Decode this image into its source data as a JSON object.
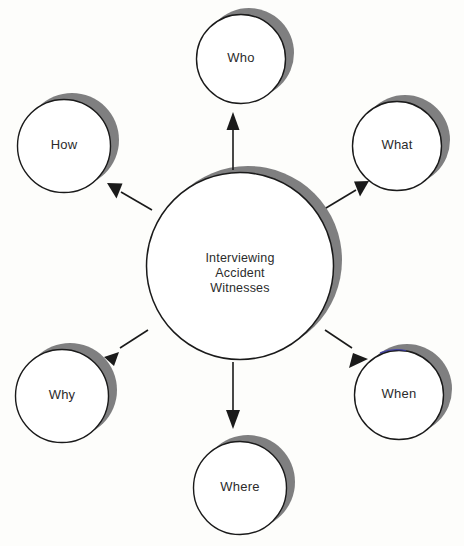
{
  "diagram": {
    "type": "hub-and-spoke-bubble-diagram",
    "title_text": "Interviewing Accident Witnesses",
    "background_color": "#fdfdfb",
    "shadow_color": "#7f7f80",
    "outline_color": "#1a1a1a",
    "text_color": "#2b2b2b",
    "center": {
      "name": "center-node",
      "lines": [
        "Interviewing",
        "Accident",
        "Witnesses"
      ],
      "line1": "Interviewing",
      "line2": "Accident",
      "line3": "Witnesses",
      "cx": 240,
      "cy": 266,
      "r": 94
    },
    "satellites": [
      {
        "id": "who",
        "label": "Who",
        "cx": 241,
        "cy": 59,
        "r": 45,
        "arrow_name": "arrow-center-to-who"
      },
      {
        "id": "what",
        "label": "What",
        "cx": 397,
        "cy": 146,
        "r": 45,
        "arrow_name": "arrow-center-to-what"
      },
      {
        "id": "when",
        "label": "When",
        "cx": 399,
        "cy": 395,
        "r": 45,
        "arrow_name": "arrow-center-to-when"
      },
      {
        "id": "where",
        "label": "Where",
        "cx": 240,
        "cy": 488,
        "r": 47,
        "arrow_name": "arrow-center-to-where"
      },
      {
        "id": "why",
        "label": "Why",
        "cx": 62,
        "cy": 396,
        "r": 47,
        "arrow_name": "arrow-center-to-why"
      },
      {
        "id": "how",
        "label": "How",
        "cx": 64,
        "cy": 146,
        "r": 47,
        "arrow_name": "arrow-center-to-how"
      }
    ]
  }
}
